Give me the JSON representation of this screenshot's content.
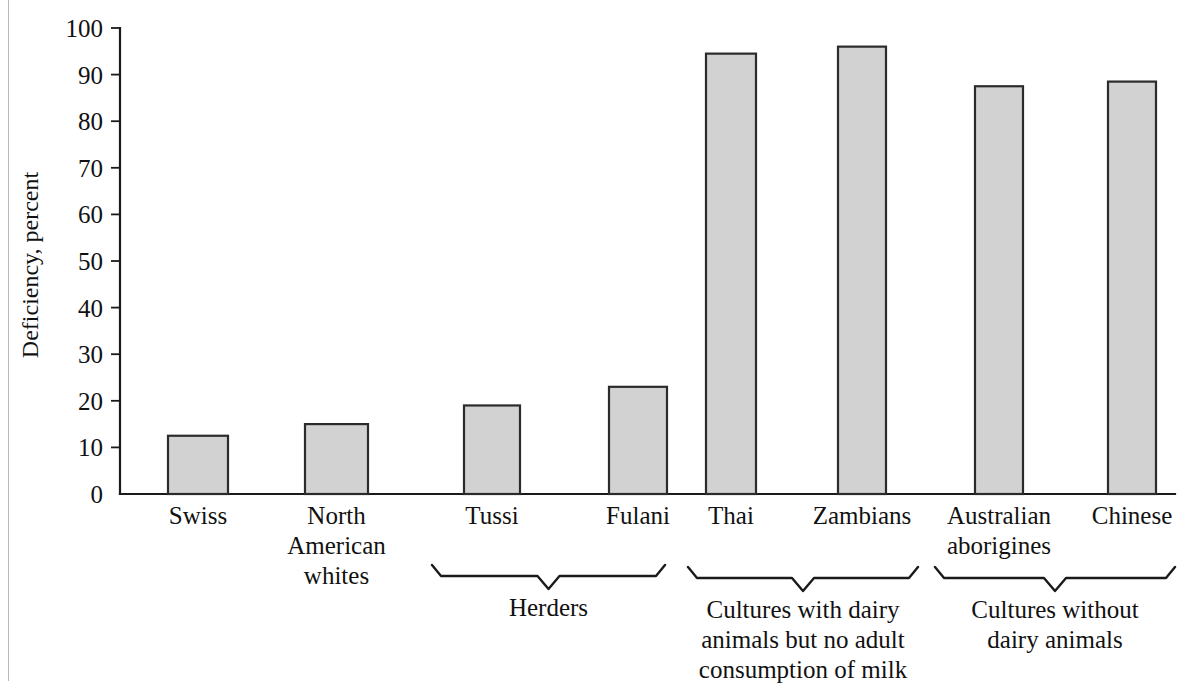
{
  "figure": {
    "axis_title": "Deficiency, percent",
    "bar_fill_color": "#d2d2d2",
    "bar_stroke_color": "#2b2b2b",
    "axis_color": "#1a1a1a",
    "page_background": "#ffffff"
  },
  "chart_data": {
    "type": "bar",
    "title": "",
    "xlabel": "",
    "ylabel": "Deficiency, percent",
    "ylim": [
      0,
      100
    ],
    "grid": false,
    "legend": "none",
    "yticks": [
      0,
      10,
      20,
      30,
      40,
      50,
      60,
      70,
      80,
      90,
      100
    ],
    "ytick_labels": [
      "0",
      "10",
      "20",
      "30",
      "40",
      "50",
      "60",
      "70",
      "80",
      "90",
      "100"
    ],
    "categories": [
      "Swiss",
      "North American whites",
      "Tussi",
      "Fulani",
      "Thai",
      "Zambians",
      "Australian aborigines",
      "Chinese"
    ],
    "values": [
      12.5,
      15,
      19,
      23,
      94.5,
      96,
      87.5,
      88.5
    ],
    "bars": [
      {
        "label_lines": [
          "Swiss"
        ],
        "value": 12.5,
        "x": 168,
        "width": 60
      },
      {
        "label_lines": [
          "North",
          "American",
          "whites"
        ],
        "value": 15,
        "x": 305,
        "width": 63
      },
      {
        "label_lines": [
          "Tussi"
        ],
        "value": 19,
        "x": 464,
        "width": 56
      },
      {
        "label_lines": [
          "Fulani"
        ],
        "value": 23,
        "x": 609,
        "width": 58
      },
      {
        "label_lines": [
          "Thai"
        ],
        "value": 94.5,
        "x": 706,
        "width": 50
      },
      {
        "label_lines": [
          "Zambians"
        ],
        "value": 96,
        "x": 838,
        "width": 48
      },
      {
        "label_lines": [
          "Australian",
          "aborigines"
        ],
        "value": 87.5,
        "x": 975,
        "width": 48
      },
      {
        "label_lines": [
          "Chinese"
        ],
        "value": 88.5,
        "x": 1108,
        "width": 48
      }
    ],
    "groups": [
      {
        "name": "herders",
        "label_lines": [
          "Herders"
        ],
        "x_start": 432,
        "x_end": 665,
        "bars": [
          "Tussi",
          "Fulani"
        ]
      },
      {
        "name": "cultures-with-dairy-no-adult-milk",
        "label_lines": [
          "Cultures with dairy",
          "animals but no adult",
          "consumption of milk"
        ],
        "x_start": 688,
        "x_end": 918,
        "bars": [
          "Thai",
          "Zambians"
        ]
      },
      {
        "name": "cultures-without-dairy",
        "label_lines": [
          "Cultures without",
          "dairy animals"
        ],
        "x_start": 935,
        "x_end": 1175,
        "bars": [
          "Australian aborigines",
          "Chinese"
        ]
      }
    ]
  }
}
